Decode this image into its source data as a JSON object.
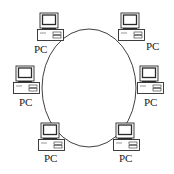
{
  "diagram": {
    "ring": {
      "cx": 89,
      "cy": 88,
      "rx": 47,
      "ry": 59,
      "stroke": "#3a3a3a"
    },
    "colors": {
      "stroke": "#2a2a2a",
      "background": "#ffffff",
      "label": "#222222"
    },
    "nodes": [
      {
        "id": "pc-top-left",
        "label": "PC",
        "x": 37,
        "y": 12,
        "label_x": 34,
        "label_y": 53
      },
      {
        "id": "pc-top-right",
        "label": "PC",
        "x": 118,
        "y": 12,
        "label_x": 146,
        "label_y": 50
      },
      {
        "id": "pc-middle-left",
        "label": "PC",
        "x": 13,
        "y": 65,
        "label_x": 19,
        "label_y": 106
      },
      {
        "id": "pc-middle-right",
        "label": "PC",
        "x": 137,
        "y": 65,
        "label_x": 144,
        "label_y": 106
      },
      {
        "id": "pc-bottom-left",
        "label": "PC",
        "x": 38,
        "y": 122,
        "label_x": 44,
        "label_y": 162
      },
      {
        "id": "pc-bottom-right",
        "label": "PC",
        "x": 113,
        "y": 122,
        "label_x": 119,
        "label_y": 162
      }
    ]
  }
}
